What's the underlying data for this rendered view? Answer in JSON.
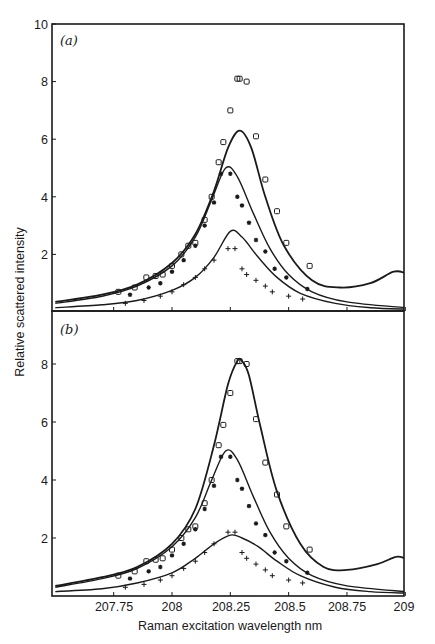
{
  "figure": {
    "ylabel": "Relative scattered intensity",
    "xlabel": "Raman excitation wavelength nm",
    "x_tick_labels": [
      "207.75",
      "208",
      "208.25",
      "208.5",
      "208.75",
      "209"
    ],
    "panels": [
      {
        "label": "(a)",
        "y_tick_labels": [
          "10",
          "8",
          "6",
          "4",
          "2"
        ]
      },
      {
        "label": "(b)",
        "y_tick_labels": [
          "8",
          "6",
          "4",
          "2"
        ]
      }
    ]
  },
  "chart_data": [
    {
      "type": "scatter",
      "title": "(a)",
      "xlabel": "Raman excitation wavelength nm",
      "ylabel": "Relative scattered intensity",
      "xlim": [
        207.5,
        209
      ],
      "ylim": [
        0,
        10
      ],
      "x_ticks": [
        207.75,
        208,
        208.25,
        208.5,
        208.75,
        209
      ],
      "y_ticks": [
        2,
        4,
        6,
        8,
        10
      ],
      "grid": false,
      "series": [
        {
          "name": "squares (data)",
          "marker": "square",
          "x": [
            207.77,
            207.84,
            207.89,
            207.93,
            207.96,
            208.0,
            208.04,
            208.07,
            208.1,
            208.14,
            208.17,
            208.2,
            208.22,
            208.25,
            208.28,
            208.29,
            208.32,
            208.36,
            208.4,
            208.45,
            208.49,
            208.59
          ],
          "y": [
            0.7,
            0.85,
            1.2,
            1.25,
            1.3,
            1.6,
            2.0,
            2.3,
            2.4,
            3.2,
            4.0,
            5.2,
            5.9,
            7.0,
            8.1,
            8.1,
            8.0,
            6.1,
            4.6,
            3.5,
            2.4,
            1.6
          ]
        },
        {
          "name": "asterisks (data)",
          "marker": "asterisk",
          "x": [
            207.82,
            207.9,
            207.95,
            208.0,
            208.05,
            208.1,
            208.14,
            208.18,
            208.21,
            208.25,
            208.28,
            208.3,
            208.33,
            208.36,
            208.4,
            208.44,
            208.49,
            208.58
          ],
          "y": [
            0.6,
            0.85,
            1.0,
            1.4,
            1.8,
            2.3,
            3.0,
            3.8,
            4.8,
            4.8,
            4.0,
            3.7,
            3.1,
            2.5,
            2.1,
            1.5,
            1.2,
            0.8
          ]
        },
        {
          "name": "crosses (data)",
          "marker": "plus",
          "x": [
            207.8,
            207.88,
            207.95,
            208.0,
            208.05,
            208.1,
            208.14,
            208.18,
            208.24,
            208.27,
            208.3,
            208.32,
            208.36,
            208.4,
            208.43,
            208.5,
            208.56
          ],
          "y": [
            0.3,
            0.4,
            0.55,
            0.7,
            0.95,
            1.2,
            1.5,
            1.8,
            2.2,
            2.2,
            1.5,
            1.3,
            1.1,
            0.9,
            0.7,
            0.55,
            0.45
          ]
        },
        {
          "name": "fit upper",
          "marker": "line",
          "x": [
            207.5,
            207.7,
            207.85,
            208.0,
            208.1,
            208.18,
            208.24,
            208.29,
            208.34,
            208.4,
            208.48,
            208.6,
            208.72,
            208.85,
            208.95,
            209.0
          ],
          "y": [
            0.35,
            0.6,
            0.95,
            1.7,
            2.7,
            4.2,
            5.7,
            6.3,
            5.7,
            4.0,
            2.3,
            1.1,
            0.85,
            1.0,
            1.4,
            1.35
          ]
        },
        {
          "name": "fit middle",
          "marker": "line",
          "x": [
            207.5,
            207.7,
            207.85,
            208.0,
            208.1,
            208.17,
            208.23,
            208.28,
            208.35,
            208.42,
            208.5,
            208.6,
            208.75,
            209.0
          ],
          "y": [
            0.3,
            0.55,
            0.9,
            1.6,
            2.6,
            3.9,
            5.0,
            4.7,
            3.4,
            2.2,
            1.3,
            0.7,
            0.35,
            0.15
          ]
        },
        {
          "name": "fit lower",
          "marker": "line",
          "x": [
            207.5,
            207.7,
            207.85,
            208.0,
            208.1,
            208.18,
            208.25,
            208.3,
            208.37,
            208.45,
            208.55,
            208.7,
            208.85,
            209.0
          ],
          "y": [
            0.15,
            0.25,
            0.4,
            0.75,
            1.2,
            1.9,
            2.8,
            2.6,
            1.9,
            1.2,
            0.65,
            0.3,
            0.15,
            0.1
          ]
        }
      ]
    },
    {
      "type": "scatter",
      "title": "(b)",
      "xlabel": "Raman excitation wavelength nm",
      "ylabel": "Relative scattered intensity",
      "xlim": [
        207.5,
        209
      ],
      "ylim": [
        0,
        9.2
      ],
      "x_ticks": [
        207.75,
        208,
        208.25,
        208.5,
        208.75,
        209
      ],
      "y_ticks": [
        2,
        4,
        6,
        8
      ],
      "grid": false,
      "series": [
        {
          "name": "squares (data)",
          "marker": "square",
          "x": [
            207.77,
            207.84,
            207.89,
            207.93,
            207.96,
            208.0,
            208.04,
            208.07,
            208.1,
            208.14,
            208.17,
            208.2,
            208.22,
            208.25,
            208.28,
            208.29,
            208.32,
            208.36,
            208.4,
            208.45,
            208.49,
            208.59
          ],
          "y": [
            0.7,
            0.85,
            1.2,
            1.25,
            1.3,
            1.6,
            2.0,
            2.3,
            2.4,
            3.2,
            4.0,
            5.2,
            5.9,
            7.0,
            8.1,
            8.1,
            8.0,
            6.1,
            4.6,
            3.5,
            2.4,
            1.6
          ]
        },
        {
          "name": "asterisks (data)",
          "marker": "asterisk",
          "x": [
            207.82,
            207.9,
            207.95,
            208.0,
            208.05,
            208.1,
            208.14,
            208.18,
            208.21,
            208.25,
            208.28,
            208.3,
            208.33,
            208.36,
            208.4,
            208.44,
            208.49,
            208.58
          ],
          "y": [
            0.6,
            0.85,
            1.0,
            1.4,
            1.8,
            2.3,
            3.0,
            3.8,
            4.8,
            4.8,
            4.0,
            3.7,
            3.1,
            2.5,
            2.1,
            1.5,
            1.2,
            0.8
          ]
        },
        {
          "name": "crosses (data)",
          "marker": "plus",
          "x": [
            207.8,
            207.88,
            207.95,
            208.0,
            208.05,
            208.1,
            208.14,
            208.18,
            208.24,
            208.27,
            208.3,
            208.32,
            208.36,
            208.4,
            208.43,
            208.5,
            208.56
          ],
          "y": [
            0.3,
            0.4,
            0.55,
            0.7,
            0.95,
            1.2,
            1.5,
            1.8,
            2.2,
            2.2,
            1.5,
            1.3,
            1.1,
            0.9,
            0.7,
            0.55,
            0.45
          ]
        },
        {
          "name": "fit upper",
          "marker": "line",
          "x": [
            207.5,
            207.7,
            207.85,
            208.0,
            208.1,
            208.18,
            208.24,
            208.28,
            208.3,
            208.33,
            208.38,
            208.45,
            208.55,
            208.65,
            208.75,
            208.88,
            208.96,
            209.0
          ],
          "y": [
            0.35,
            0.65,
            1.0,
            1.8,
            3.0,
            5.2,
            7.3,
            8.1,
            8.1,
            7.6,
            5.8,
            3.6,
            1.8,
            1.0,
            0.9,
            1.1,
            1.35,
            1.3
          ]
        },
        {
          "name": "fit middle",
          "marker": "line",
          "x": [
            207.5,
            207.7,
            207.85,
            208.0,
            208.1,
            208.17,
            208.23,
            208.28,
            208.35,
            208.42,
            208.5,
            208.6,
            208.75,
            209.0
          ],
          "y": [
            0.3,
            0.6,
            0.95,
            1.7,
            2.7,
            4.0,
            5.0,
            4.7,
            3.4,
            2.2,
            1.3,
            0.7,
            0.35,
            0.15
          ]
        },
        {
          "name": "fit lower",
          "marker": "line",
          "x": [
            207.5,
            207.7,
            207.85,
            208.0,
            208.1,
            208.18,
            208.25,
            208.3,
            208.37,
            208.45,
            208.55,
            208.7,
            208.85,
            209.0
          ],
          "y": [
            0.15,
            0.25,
            0.45,
            0.8,
            1.3,
            1.8,
            2.1,
            2.0,
            1.7,
            1.2,
            0.7,
            0.3,
            0.15,
            0.1
          ]
        }
      ]
    }
  ]
}
